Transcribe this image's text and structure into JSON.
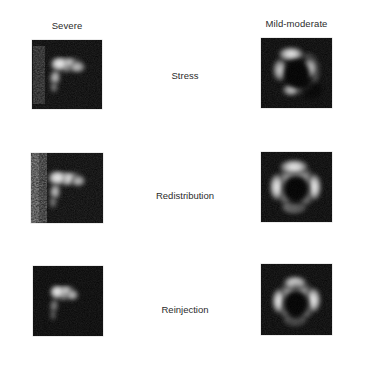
{
  "figure": {
    "background_color": "#ffffff",
    "panel_background_color": "#000000",
    "text_color": "#2b2b2b",
    "modality": "SPECT myocardial perfusion short-axis tomograms",
    "layout": "2 columns x 3 rows"
  },
  "columns": [
    {
      "id": "severe",
      "label": "Severe"
    },
    {
      "id": "mild-moderate",
      "label": "Mild-moderate"
    }
  ],
  "rows": [
    {
      "id": "stress",
      "label": "Stress"
    },
    {
      "id": "redistribution",
      "label": "Redistribution"
    },
    {
      "id": "reinjection",
      "label": "Reinjection"
    }
  ],
  "panels": [
    {
      "id": "panel-severe-stress",
      "column": "Severe",
      "row": "Stress",
      "description": "Short-axis myocardial perfusion image, anterolateral tracer uptake with large inferior and septal defect"
    },
    {
      "id": "panel-mild-moderate-stress",
      "column": "Mild-moderate",
      "row": "Stress",
      "description": "Short-axis myocardial perfusion image, near-complete ring with reduced inferior uptake"
    },
    {
      "id": "panel-severe-redistribution",
      "column": "Severe",
      "row": "Redistribution",
      "description": "Short-axis myocardial perfusion image, persistent large inferoseptal defect"
    },
    {
      "id": "panel-mild-moderate-redistribution",
      "column": "Mild-moderate",
      "row": "Redistribution",
      "description": "Short-axis myocardial perfusion image, complete ring of tracer uptake"
    },
    {
      "id": "panel-severe-reinjection",
      "column": "Severe",
      "row": "Reinjection",
      "description": "Short-axis myocardial perfusion image, small anterolateral uptake, persistent severe defect"
    },
    {
      "id": "panel-mild-moderate-reinjection",
      "column": "Mild-moderate",
      "row": "Reinjection",
      "description": "Short-axis myocardial perfusion image, complete ring with improved inferior uptake"
    }
  ]
}
